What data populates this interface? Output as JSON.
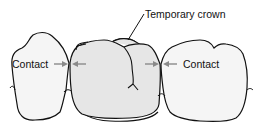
{
  "diagram": {
    "type": "dental illustration",
    "labels": {
      "temporary_crown": "Temporary crown",
      "contact_left": "Contact",
      "contact_right": "Contact"
    },
    "elements": [
      {
        "name": "left-adjacent-tooth",
        "fill": "#f4f4f4"
      },
      {
        "name": "temporary-crown",
        "fill": "#e6e6e6"
      },
      {
        "name": "right-adjacent-tooth",
        "fill": "#f4f4f4"
      }
    ],
    "colors": {
      "outline": "#111111",
      "arrow": "#8a8a8a",
      "crown_fill": "#e6e6e6",
      "tooth_fill": "#f5f5f5",
      "background": "#ffffff"
    }
  }
}
